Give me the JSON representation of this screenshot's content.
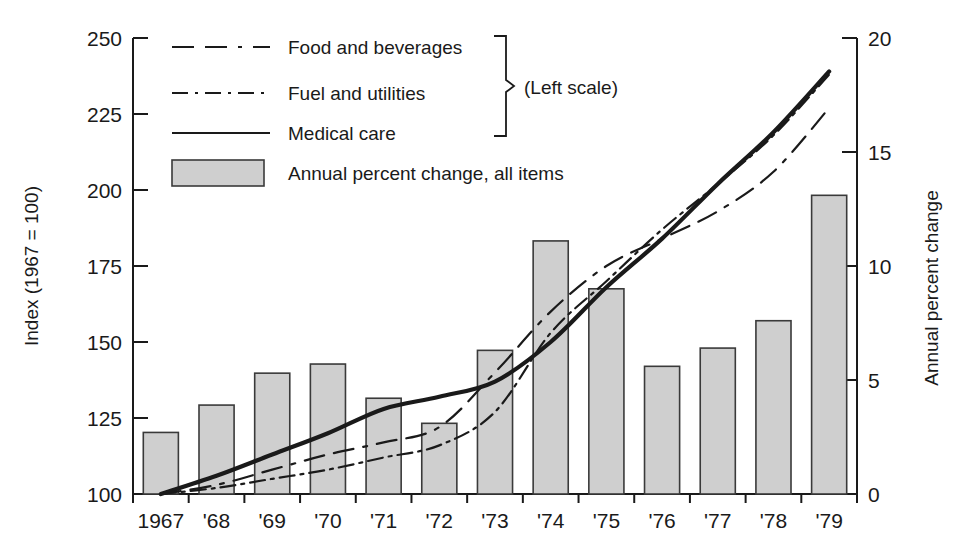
{
  "chart_data": {
    "type": "bar",
    "title": "",
    "categories": [
      "1967",
      "'68",
      "'69",
      "'70",
      "'71",
      "'72",
      "'73",
      "'74",
      "'75",
      "'76",
      "'77",
      "'78",
      "'79"
    ],
    "x_years": [
      1967,
      1968,
      1969,
      1970,
      1971,
      1972,
      1973,
      1974,
      1975,
      1976,
      1977,
      1978,
      1979
    ],
    "xlabel": "",
    "ylabel": "Index (1967 = 100)",
    "ylabel_right": "Annual percent change",
    "ylim": [
      100,
      250
    ],
    "yticks": [
      100,
      125,
      150,
      175,
      200,
      225,
      250
    ],
    "ylim_right": [
      0,
      20
    ],
    "yticks_right": [
      0,
      5,
      10,
      15,
      20
    ],
    "grid": false,
    "legend_position": "top-center",
    "legend_note": "(Left scale)",
    "bars": {
      "name": "Annual percent change, all items",
      "axis": "right",
      "unit": "percent",
      "values": [
        2.7,
        3.9,
        5.3,
        5.7,
        4.2,
        3.1,
        6.3,
        11.1,
        9.0,
        5.6,
        6.4,
        7.6,
        13.1
      ]
    },
    "series": [
      {
        "name": "Food and beverages",
        "axis": "left",
        "style": "dashed",
        "values": [
          100,
          103,
          108,
          113,
          117,
          122,
          140,
          160,
          175,
          184,
          193,
          206,
          227
        ]
      },
      {
        "name": "Fuel and utilities",
        "axis": "left",
        "style": "dash-dot",
        "values": [
          100,
          102,
          105,
          108,
          112,
          116,
          127,
          153,
          170,
          187,
          202,
          218,
          238
        ]
      },
      {
        "name": "Medical care",
        "axis": "left",
        "style": "solid",
        "values": [
          100,
          106,
          113,
          120,
          128,
          132,
          137,
          150,
          168,
          184,
          202,
          219,
          239
        ]
      }
    ]
  },
  "axes": {
    "left": {
      "title": "Index (1967 = 100)",
      "ticks": [
        "250",
        "225",
        "200",
        "175",
        "150",
        "125",
        "100"
      ]
    },
    "right": {
      "title": "Annual percent change",
      "ticks": [
        "20",
        "15",
        "10",
        "5",
        "0"
      ]
    },
    "bottom": {
      "ticks": [
        "1967",
        "'68",
        "'69",
        "'70",
        "'71",
        "'72",
        "'73",
        "'74",
        "'75",
        "'76",
        "'77",
        "'78",
        "'79"
      ]
    }
  },
  "legend": {
    "items": [
      {
        "label": "Food and beverages",
        "style": "dashed"
      },
      {
        "label": "Fuel and utilities",
        "style": "dash-dot"
      },
      {
        "label": "Medical care",
        "style": "solid"
      },
      {
        "label": "Annual percent change, all items",
        "style": "swatch"
      }
    ],
    "scale_note": "(Left scale)"
  },
  "colors": {
    "bar_fill": "#cfcfcf",
    "bar_stroke": "#3a3a3a",
    "line": "#1a1a1a",
    "background": "#ffffff"
  }
}
